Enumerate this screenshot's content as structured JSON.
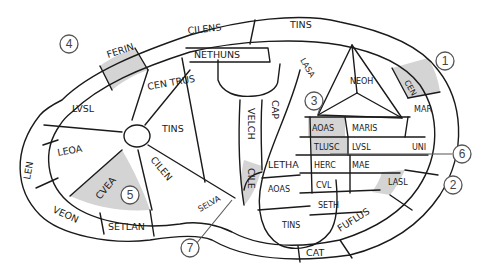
{
  "diagram": {
    "colors": {
      "line": "#1a1a1a",
      "shading": "#d4d4d4",
      "callout": "#555555",
      "background": "#ffffff"
    },
    "callouts": [
      {
        "id": "1",
        "label": "1"
      },
      {
        "id": "2",
        "label": "2"
      },
      {
        "id": "3",
        "label": "3"
      },
      {
        "id": "4",
        "label": "4"
      },
      {
        "id": "5",
        "label": "5"
      },
      {
        "id": "6",
        "label": "6"
      },
      {
        "id": "7",
        "label": "7"
      }
    ],
    "outer_ring": [
      {
        "text": "CILENS"
      },
      {
        "text": "FERIN"
      },
      {
        "text": "CEN"
      },
      {
        "text": "LEN"
      },
      {
        "text": "TINS"
      },
      {
        "text": "VEON"
      },
      {
        "text": "UNI"
      },
      {
        "text": "FUFLUS"
      },
      {
        "text": "CAT"
      },
      {
        "text": "SETLAN"
      },
      {
        "text": "MAR"
      },
      {
        "text": "LASL"
      }
    ],
    "inner_left": [
      {
        "text": "CEN TRUS"
      },
      {
        "text": "TINS"
      },
      {
        "text": "LVSL"
      },
      {
        "text": "LEOA"
      },
      {
        "text": "CILEN"
      },
      {
        "text": "CVEA"
      },
      {
        "text": "SELVA"
      }
    ],
    "inner_center": [
      {
        "text": "VELCH"
      },
      {
        "text": "LASA"
      },
      {
        "text": "NETHUNS"
      },
      {
        "text": "NEOH"
      },
      {
        "text": "AIM"
      },
      {
        "text": "CILE"
      },
      {
        "text": "TINS"
      }
    ],
    "inner_right": [
      {
        "text": "AOAS"
      },
      {
        "text": "MARIS"
      },
      {
        "text": "TLUSC"
      },
      {
        "text": "LVSL"
      },
      {
        "text": "HERC"
      },
      {
        "text": "MAE"
      },
      {
        "text": "CVL"
      },
      {
        "text": "SETH"
      },
      {
        "text": "LETHA"
      },
      {
        "text": "CAP"
      }
    ]
  }
}
